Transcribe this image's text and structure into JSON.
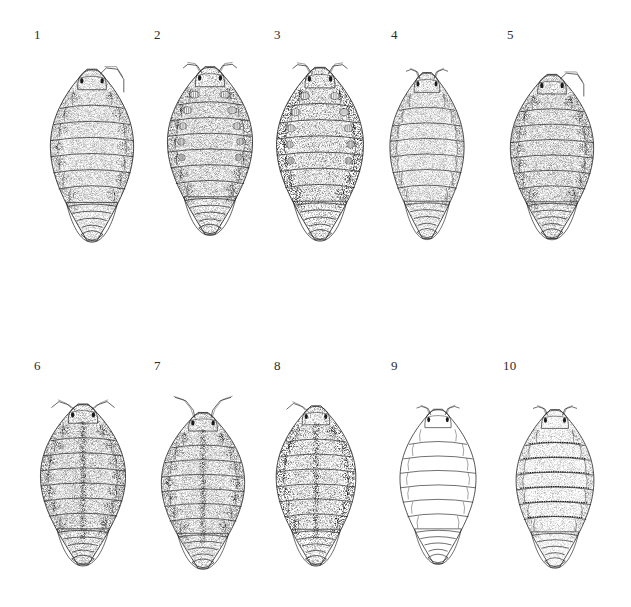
{
  "plate": {
    "background_color": "#ffffff",
    "ink_color": "#1a1a1a",
    "layout": "2 rows x 5 columns",
    "view": "dorsal habitus",
    "subject": "terrestrial isopods (woodlice)",
    "figure_count": 10
  },
  "figures": [
    {
      "label": "1",
      "label_x": 34,
      "label_y": 28,
      "x": 46,
      "y": 50,
      "width": 92,
      "height": 205,
      "style": "stippled",
      "tone": "light",
      "shading": 0.42,
      "antenna": "right-only-trailing",
      "segments": 7,
      "lateral_blotches": true,
      "pale_patches": false,
      "median_stripe": false,
      "dotted_bands": false
    },
    {
      "label": "2",
      "label_x": 154,
      "label_y": 28,
      "x": 163,
      "y": 48,
      "width": 94,
      "height": 200,
      "style": "stippled",
      "tone": "medium",
      "shading": 0.58,
      "antenna": "both-short-lateral",
      "segments": 7,
      "lateral_blotches": true,
      "pale_patches": true,
      "median_stripe": false,
      "dotted_bands": false
    },
    {
      "label": "3",
      "label_x": 274,
      "label_y": 28,
      "x": 272,
      "y": 48,
      "width": 96,
      "height": 206,
      "style": "stippled",
      "tone": "dark",
      "shading": 0.74,
      "antenna": "both-short-lateral",
      "segments": 7,
      "lateral_blotches": true,
      "pale_patches": true,
      "median_stripe": false,
      "dotted_bands": false
    },
    {
      "label": "4",
      "label_x": 391,
      "label_y": 28,
      "x": 386,
      "y": 54,
      "width": 82,
      "height": 198,
      "style": "stippled",
      "tone": "light",
      "shading": 0.4,
      "antenna": "both-short-forward",
      "segments": 7,
      "lateral_blotches": false,
      "pale_patches": false,
      "median_stripe": false,
      "dotted_bands": false
    },
    {
      "label": "5",
      "label_x": 507,
      "label_y": 28,
      "x": 506,
      "y": 56,
      "width": 92,
      "height": 196,
      "style": "stippled",
      "tone": "medium",
      "shading": 0.6,
      "antenna": "right-only-trailing",
      "segments": 7,
      "lateral_blotches": true,
      "pale_patches": false,
      "median_stripe": false,
      "dotted_bands": false
    },
    {
      "label": "6",
      "label_x": 34,
      "label_y": 359,
      "x": 36,
      "y": 386,
      "width": 94,
      "height": 192,
      "style": "stippled",
      "tone": "medium",
      "shading": 0.62,
      "antenna": "both-angled-outward",
      "segments": 7,
      "lateral_blotches": true,
      "pale_patches": false,
      "median_stripe": true,
      "dotted_bands": false
    },
    {
      "label": "7",
      "label_x": 154,
      "label_y": 359,
      "x": 157,
      "y": 395,
      "width": 92,
      "height": 186,
      "style": "stippled",
      "tone": "medium",
      "shading": 0.55,
      "antenna": "both-raised-long",
      "segments": 7,
      "lateral_blotches": true,
      "pale_patches": false,
      "median_stripe": true,
      "dotted_bands": false
    },
    {
      "label": "8",
      "label_x": 274,
      "label_y": 359,
      "x": 272,
      "y": 388,
      "width": 88,
      "height": 190,
      "style": "stippled",
      "tone": "dark",
      "shading": 0.7,
      "antenna": "left-only-raised",
      "segments": 7,
      "lateral_blotches": true,
      "pale_patches": false,
      "median_stripe": true,
      "dotted_bands": false
    },
    {
      "label": "9",
      "label_x": 391,
      "label_y": 359,
      "x": 396,
      "y": 392,
      "width": 84,
      "height": 184,
      "style": "outline",
      "tone": "none",
      "shading": 0.0,
      "antenna": "both-short-forward",
      "segments": 7,
      "lateral_blotches": false,
      "pale_patches": false,
      "median_stripe": false,
      "dotted_bands": false
    },
    {
      "label": "10",
      "label_x": 503,
      "label_y": 359,
      "x": 512,
      "y": 392,
      "width": 86,
      "height": 188,
      "style": "stippled",
      "tone": "light",
      "shading": 0.3,
      "antenna": "both-short-forward",
      "segments": 7,
      "lateral_blotches": false,
      "pale_patches": false,
      "median_stripe": false,
      "dotted_bands": true
    }
  ]
}
